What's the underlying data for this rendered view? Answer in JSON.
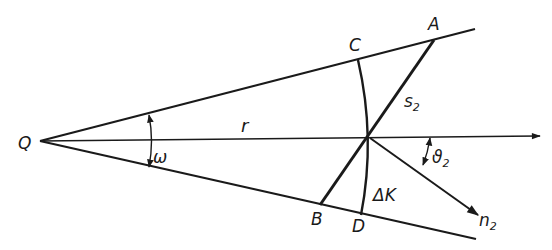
{
  "diagram": {
    "labels": {
      "source": "Q",
      "point_a": "A",
      "point_b": "B",
      "point_c": "C",
      "point_d": "D",
      "radius": "r",
      "angle_omega": "ω",
      "segment_s": "s",
      "segment_s_sub": "2",
      "angle_theta": "ϑ",
      "angle_theta_sub": "2",
      "normal_n": "n",
      "normal_n_sub": "2",
      "arc_delta_k": "ΔK"
    },
    "colors": {
      "ink": "#1a1a1a",
      "background": "#ffffff"
    }
  }
}
